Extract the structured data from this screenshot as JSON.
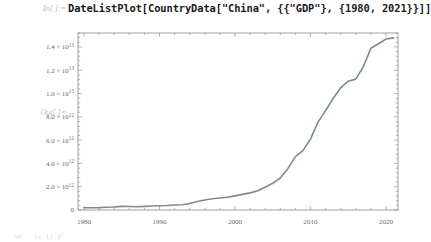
{
  "notebook": {
    "input_cell": {
      "label": "In[ ]:=",
      "code": "DateListPlot[CountryData[\"China\", {{\"GDP\"}, {1980, 2021}}]]"
    },
    "output_cell": {
      "label": "Out[ ]="
    },
    "ghost_text": "W            GDP"
  },
  "colors": {
    "line": "#7b8a95",
    "frame": "#787878",
    "tick": "#8a8a8a",
    "label": "#6e6e6e",
    "code": "#1a1a1a",
    "prompt": "#b9b9bd",
    "background": "#ffffff"
  },
  "chart_data": {
    "type": "line",
    "title": "",
    "xlabel": "",
    "ylabel": "",
    "xlim": [
      1979.2,
      2021.6
    ],
    "ylim": [
      0,
      15200000000000
    ],
    "grid": false,
    "legend": null,
    "frame": true,
    "x_ticks": [
      1980,
      1990,
      2000,
      2010,
      2020
    ],
    "x_tick_labels": [
      "1980",
      "1990",
      "2000",
      "2010",
      "2020"
    ],
    "x_minor_tick_step": 2,
    "y_ticks": [
      0,
      2000000000000,
      4000000000000,
      6000000000000,
      8000000000000,
      10000000000000,
      12000000000000,
      14000000000000
    ],
    "y_tick_labels": [
      {
        "mantissa": "0",
        "times": "",
        "base": "",
        "exponent": ""
      },
      {
        "mantissa": "2.0",
        "times": "×",
        "base": "10",
        "exponent": "12"
      },
      {
        "mantissa": "4.0",
        "times": "×",
        "base": "10",
        "exponent": "12"
      },
      {
        "mantissa": "6.0",
        "times": "×",
        "base": "10",
        "exponent": "12"
      },
      {
        "mantissa": "8.0",
        "times": "×",
        "base": "10",
        "exponent": "12"
      },
      {
        "mantissa": "1.0",
        "times": "×",
        "base": "10",
        "exponent": "13"
      },
      {
        "mantissa": "1.2",
        "times": "×",
        "base": "10",
        "exponent": "13"
      },
      {
        "mantissa": "1.4",
        "times": "×",
        "base": "10",
        "exponent": "13"
      }
    ],
    "series": [
      {
        "name": "China GDP (USD)",
        "x": [
          1980,
          1981,
          1982,
          1983,
          1984,
          1985,
          1986,
          1987,
          1988,
          1989,
          1990,
          1991,
          1992,
          1993,
          1994,
          1995,
          1996,
          1997,
          1998,
          1999,
          2000,
          2001,
          2002,
          2003,
          2004,
          2005,
          2006,
          2007,
          2008,
          2009,
          2010,
          2011,
          2012,
          2013,
          2014,
          2015,
          2016,
          2017,
          2018,
          2019,
          2020,
          2021
        ],
        "values": [
          191000000000.0,
          196000000000.0,
          205000000000.0,
          230000000000.0,
          259000000000.0,
          309000000000.0,
          301000000000.0,
          273000000000.0,
          313000000000.0,
          348000000000.0,
          361000000000.0,
          383000000000.0,
          427000000000.0,
          445000000000.0,
          564000000000.0,
          735000000000.0,
          864000000000.0,
          962000000000.0,
          1030000000000.0,
          1090000000000.0,
          1210000000000.0,
          1340000000000.0,
          1470000000000.0,
          1660000000000.0,
          1960000000000.0,
          2290000000000.0,
          2750000000000.0,
          3550000000000.0,
          4590000000000.0,
          5100000000000.0,
          6090000000000.0,
          7550000000000.0,
          8530000000000.0,
          9570000000000.0,
          10480000000000.0,
          11060000000000.0,
          11240000000000.0,
          12290000000000.0,
          13890000000000.0,
          14280000000000.0,
          14680000000000.0,
          14780000000000.0
        ]
      }
    ]
  }
}
